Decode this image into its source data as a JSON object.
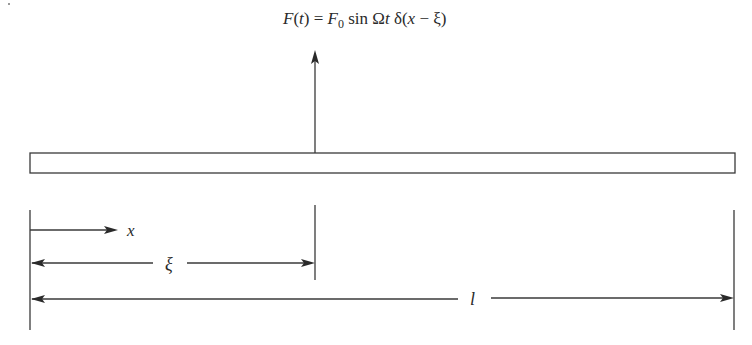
{
  "diagram": {
    "force_label": {
      "parts": [
        "F(",
        "t",
        ") = F",
        "0",
        " sin Ω",
        "t",
        " δ(",
        "x",
        " − ξ)"
      ],
      "full_text": "F(t) = F0 sin Ωt δ(x − ξ)"
    },
    "dimensions": {
      "x_label": "x",
      "xi_label": "ξ",
      "length_label": "l"
    },
    "colors": {
      "line": "#3a3a3a",
      "text": "#2a2a2a",
      "background": "#ffffff"
    }
  }
}
